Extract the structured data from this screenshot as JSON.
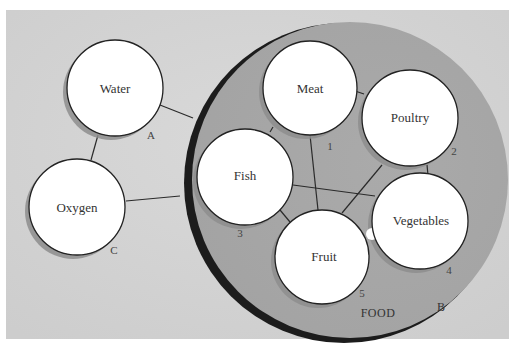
{
  "diagram": {
    "type": "node-link concept diagram",
    "background_color": "#d3d3d3",
    "group_fill_color": "#a8a8a8",
    "group_rim_color": "#1a1a1a",
    "node_fill_color": "#ffffff",
    "group": {
      "label": "FOOD",
      "letter": "B"
    },
    "nodes": [
      {
        "id": "water",
        "label": "Water",
        "tag": "A"
      },
      {
        "id": "oxygen",
        "label": "Oxygen",
        "tag": "C"
      },
      {
        "id": "meat",
        "label": "Meat",
        "tag": "1"
      },
      {
        "id": "poultry",
        "label": "Poultry",
        "tag": "2"
      },
      {
        "id": "fish",
        "label": "Fish",
        "tag": "3"
      },
      {
        "id": "vegetables",
        "label": "Vegetables",
        "tag": "4"
      },
      {
        "id": "fruit",
        "label": "Fruit",
        "tag": "5"
      }
    ],
    "edges": [
      [
        "water",
        "oxygen"
      ],
      [
        "water",
        "food"
      ],
      [
        "oxygen",
        "food"
      ],
      [
        "meat",
        "poultry"
      ],
      [
        "meat",
        "fish"
      ],
      [
        "meat",
        "fruit"
      ],
      [
        "fish",
        "vegetables"
      ],
      [
        "fish",
        "fruit"
      ],
      [
        "poultry",
        "fruit"
      ],
      [
        "poultry",
        "vegetables"
      ],
      [
        "fruit",
        "vegetables"
      ]
    ]
  }
}
